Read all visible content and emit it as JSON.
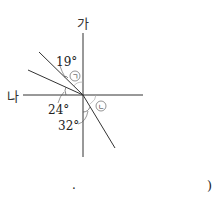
{
  "diagram": {
    "axis_labels": {
      "top": "가",
      "left": "나"
    },
    "angles": [
      {
        "label": "19°",
        "value": 19
      },
      {
        "label": "24°",
        "value": 24
      },
      {
        "label": "32°",
        "value": 32
      }
    ],
    "markers": {
      "a": "ㄱ",
      "b": "ㄴ"
    },
    "footer": {
      "dot": "·",
      "paren": ")"
    }
  }
}
